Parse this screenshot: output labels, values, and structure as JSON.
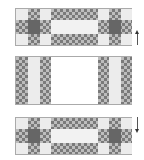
{
  "diagram": {
    "panels": [
      {
        "name": "top-tile-pattern",
        "arrow": "up"
      },
      {
        "name": "middle-tile-pattern"
      },
      {
        "name": "bottom-tile-pattern",
        "arrow": "down"
      }
    ],
    "colors": {
      "checker_dark": "#7a7a7a",
      "checker_light": "#bdbdbd",
      "light_cell": "#ececec",
      "dark_cell": "#666666"
    }
  }
}
